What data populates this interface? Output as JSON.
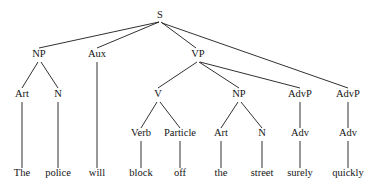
{
  "figure": {
    "kind": "syntax-tree",
    "sentence": "The police will block off the street surely quickly",
    "width": 378,
    "height": 187,
    "line_color": "#1a1a1a",
    "text_color": "#141414",
    "background": "#ffffff"
  },
  "nodes": {
    "s": {
      "label": "S",
      "x": 160,
      "y": 18
    },
    "np1": {
      "label": "NP",
      "x": 39,
      "y": 57
    },
    "aux": {
      "label": "Aux",
      "x": 97,
      "y": 57
    },
    "vp": {
      "label": "VP",
      "x": 198,
      "y": 57
    },
    "art1": {
      "label": "Art",
      "x": 22,
      "y": 97
    },
    "n1": {
      "label": "N",
      "x": 58,
      "y": 97
    },
    "v": {
      "label": "V",
      "x": 158,
      "y": 97
    },
    "np2": {
      "label": "NP",
      "x": 239,
      "y": 97
    },
    "advp1": {
      "label": "AdvP",
      "x": 300,
      "y": 97
    },
    "advp2": {
      "label": "AdvP",
      "x": 348,
      "y": 97
    },
    "verb": {
      "label": "Verb",
      "x": 141,
      "y": 136
    },
    "particle": {
      "label": "Particle",
      "x": 180,
      "y": 136
    },
    "art2": {
      "label": "Art",
      "x": 221,
      "y": 136
    },
    "n2": {
      "label": "N",
      "x": 262,
      "y": 136
    },
    "adv1": {
      "label": "Adv",
      "x": 300,
      "y": 136
    },
    "adv2": {
      "label": "Adv",
      "x": 348,
      "y": 136
    }
  },
  "leaves": {
    "the1": {
      "label": "The",
      "x": 22,
      "y": 176
    },
    "police": {
      "label": "police",
      "x": 58,
      "y": 176
    },
    "will": {
      "label": "will",
      "x": 97,
      "y": 176
    },
    "block": {
      "label": "block",
      "x": 141,
      "y": 176
    },
    "off": {
      "label": "off",
      "x": 180,
      "y": 176
    },
    "the2": {
      "label": "the",
      "x": 221,
      "y": 176
    },
    "street": {
      "label": "street",
      "x": 262,
      "y": 176
    },
    "surely": {
      "label": "surely",
      "x": 300,
      "y": 176
    },
    "quickly": {
      "label": "quickly",
      "x": 348,
      "y": 176
    }
  },
  "edges": [
    {
      "name": "s-to-np",
      "from": "s",
      "to": "np1",
      "x1": 159,
      "y1": 22,
      "x2": 39,
      "y2": 48
    },
    {
      "name": "s-to-aux",
      "from": "s",
      "to": "aux",
      "x1": 159,
      "y1": 22,
      "x2": 97,
      "y2": 48
    },
    {
      "name": "s-to-vp",
      "from": "s",
      "to": "vp",
      "x1": 161,
      "y1": 22,
      "x2": 196,
      "y2": 48
    },
    {
      "name": "s-to-advp2",
      "from": "s",
      "to": "advp2",
      "x1": 162,
      "y1": 23,
      "x2": 348,
      "y2": 88
    },
    {
      "name": "np1-to-art1",
      "from": "np1",
      "to": "art1",
      "x1": 38,
      "y1": 62,
      "x2": 22,
      "y2": 88
    },
    {
      "name": "np1-to-n1",
      "from": "np1",
      "to": "n1",
      "x1": 41,
      "y1": 62,
      "x2": 58,
      "y2": 88
    },
    {
      "name": "aux-to-will",
      "from": "aux",
      "to": "will",
      "x1": 97,
      "y1": 62,
      "x2": 97,
      "y2": 168
    },
    {
      "name": "vp-to-v",
      "from": "vp",
      "to": "v",
      "x1": 197,
      "y1": 62,
      "x2": 158,
      "y2": 88
    },
    {
      "name": "vp-to-np2",
      "from": "vp",
      "to": "np2",
      "x1": 199,
      "y1": 62,
      "x2": 239,
      "y2": 88
    },
    {
      "name": "vp-to-advp1",
      "from": "vp",
      "to": "advp1",
      "x1": 200,
      "y1": 62,
      "x2": 300,
      "y2": 88
    },
    {
      "name": "v-to-verb",
      "from": "v",
      "to": "verb",
      "x1": 157,
      "y1": 102,
      "x2": 141,
      "y2": 128
    },
    {
      "name": "v-to-particle",
      "from": "v",
      "to": "particle",
      "x1": 160,
      "y1": 102,
      "x2": 180,
      "y2": 128
    },
    {
      "name": "np2-to-art2",
      "from": "np2",
      "to": "art2",
      "x1": 238,
      "y1": 102,
      "x2": 221,
      "y2": 128
    },
    {
      "name": "np2-to-n2",
      "from": "np2",
      "to": "n2",
      "x1": 241,
      "y1": 102,
      "x2": 262,
      "y2": 128
    },
    {
      "name": "advp1-to-adv1",
      "from": "advp1",
      "to": "adv1",
      "x1": 300,
      "y1": 102,
      "x2": 300,
      "y2": 128
    },
    {
      "name": "advp2-to-adv2",
      "from": "advp2",
      "to": "adv2",
      "x1": 348,
      "y1": 102,
      "x2": 348,
      "y2": 128
    },
    {
      "name": "art1-to-the1",
      "from": "art1",
      "to": "the1",
      "x1": 22,
      "y1": 102,
      "x2": 22,
      "y2": 168
    },
    {
      "name": "n1-to-police",
      "from": "n1",
      "to": "police",
      "x1": 58,
      "y1": 102,
      "x2": 58,
      "y2": 168
    },
    {
      "name": "verb-to-block",
      "from": "verb",
      "to": "block",
      "x1": 141,
      "y1": 141,
      "x2": 141,
      "y2": 168
    },
    {
      "name": "particle-to-off",
      "from": "particle",
      "to": "off",
      "x1": 180,
      "y1": 141,
      "x2": 180,
      "y2": 168
    },
    {
      "name": "art2-to-the2",
      "from": "art2",
      "to": "the2",
      "x1": 221,
      "y1": 141,
      "x2": 221,
      "y2": 168
    },
    {
      "name": "n2-to-street",
      "from": "n2",
      "to": "street",
      "x1": 262,
      "y1": 141,
      "x2": 262,
      "y2": 168
    },
    {
      "name": "adv1-to-surely",
      "from": "adv1",
      "to": "surely",
      "x1": 300,
      "y1": 141,
      "x2": 300,
      "y2": 168
    },
    {
      "name": "adv2-to-quickly",
      "from": "adv2",
      "to": "quickly",
      "x1": 348,
      "y1": 141,
      "x2": 348,
      "y2": 168
    }
  ]
}
